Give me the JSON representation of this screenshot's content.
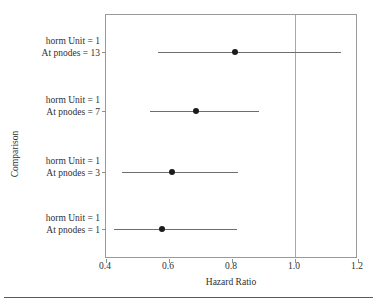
{
  "chart_data": {
    "type": "scatter",
    "subtype": "forest-plot",
    "title": "",
    "xlabel": "Hazard Ratio",
    "ylabel": "Comparison",
    "xlim": [
      0.4,
      1.2
    ],
    "xticks": [
      "0.4",
      "0.6",
      "0.8",
      "1.0",
      "1.2"
    ],
    "xtick_values": [
      0.4,
      0.6,
      0.8,
      1.0,
      1.2
    ],
    "grid": false,
    "legend": "none",
    "reference_line": 1.0,
    "categories": [
      "horm Unit = 1 At pnodes = 13",
      "horm Unit = 1 At pnodes = 7",
      "horm Unit = 1 At pnodes = 3",
      "horm Unit = 1 At pnodes = 1"
    ],
    "rows": [
      {
        "label_line1": "horm Unit = 1",
        "label_line2": "At pnodes = 13",
        "estimate": 0.81,
        "ci_low": 0.565,
        "ci_high": 1.145
      },
      {
        "label_line1": "horm Unit = 1",
        "label_line2": "At pnodes = 7",
        "estimate": 0.685,
        "ci_low": 0.54,
        "ci_high": 0.885
      },
      {
        "label_line1": "horm Unit = 1",
        "label_line2": "At pnodes = 3",
        "estimate": 0.61,
        "ci_low": 0.452,
        "ci_high": 0.82
      },
      {
        "label_line1": "horm Unit = 1",
        "label_line2": "At pnodes = 1",
        "estimate": 0.578,
        "ci_low": 0.425,
        "ci_high": 0.815
      }
    ],
    "colors": {
      "marker": "#1b1b1b",
      "ci_line": "#6d6d6d",
      "frame": "#9a9a9a",
      "reference_line": "#a8a8a8",
      "text": "#2f2f2f"
    }
  }
}
